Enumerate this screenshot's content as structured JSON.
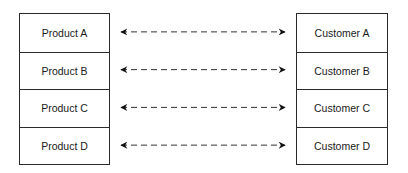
{
  "products": [
    {
      "label": "Product A"
    },
    {
      "label": "Product B"
    },
    {
      "label": "Product C"
    },
    {
      "label": "Product D"
    }
  ],
  "customers": [
    {
      "label": "Customer A"
    },
    {
      "label": "Customer B"
    },
    {
      "label": "Customer C"
    },
    {
      "label": "Customer D"
    }
  ],
  "connections": [
    {
      "from": "Product A",
      "to": "Customer A",
      "style": "dashed",
      "direction": "bidirectional"
    },
    {
      "from": "Product B",
      "to": "Customer B",
      "style": "dashed",
      "direction": "bidirectional"
    },
    {
      "from": "Product C",
      "to": "Customer C",
      "style": "dashed",
      "direction": "bidirectional"
    },
    {
      "from": "Product D",
      "to": "Customer D",
      "style": "dashed",
      "direction": "bidirectional"
    }
  ]
}
